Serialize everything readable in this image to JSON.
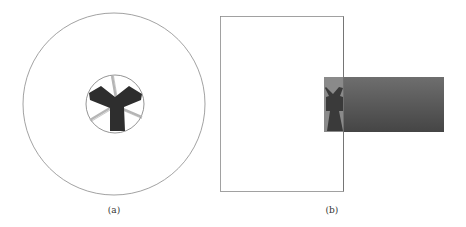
{
  "panels": [
    {
      "id": "a",
      "label": "(a)",
      "description": "Cross-section view: large outer circle with small inner circle containing a dark three-armed (Y-shaped) rotor and three light radial vanes"
    },
    {
      "id": "b",
      "label": "(b)",
      "description": "Side view: tall outlined rectangle with a dark horizontal cylinder inserted through its right edge, showing the rotor silhouette at the inner end"
    }
  ],
  "colors": {
    "outline": "#7a7a7a",
    "rotor": "#2e2e2e",
    "vane": "#bdbdbd",
    "cylinder_dark": "#4a4a4a",
    "cylinder_light": "#6e6e6e",
    "cylinder_inner": "#8a8a8a"
  }
}
